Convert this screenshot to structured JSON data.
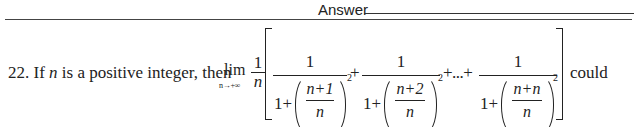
{
  "header": {
    "answer_label": "Answer"
  },
  "question": {
    "number": "22.",
    "text_before_var": "If",
    "variable": "n",
    "text_after_var": "is a positive integer, then",
    "limit": {
      "operator": "lim",
      "subscript": "n→+∞",
      "coefficient_numerator": "1",
      "coefficient_denominator": "n"
    },
    "terms": [
      {
        "numerator": "1",
        "one_plus": "1+",
        "inner_numerator": "n+1",
        "inner_denominator": "n",
        "exponent": "2"
      },
      {
        "numerator": "1",
        "one_plus": "1+",
        "inner_numerator": "n+2",
        "inner_denominator": "n",
        "exponent": "2"
      },
      {
        "numerator": "1",
        "one_plus": "1+",
        "inner_numerator": "n+n",
        "inner_denominator": "n",
        "exponent": "2"
      }
    ],
    "plus": "+",
    "ellipsis_connector": "+...+",
    "text_after": "could"
  }
}
